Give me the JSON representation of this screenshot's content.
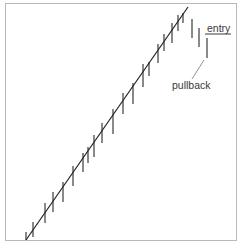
{
  "diagram": {
    "labels": {
      "entry": "entry",
      "pullback": "pullback"
    },
    "colors": {
      "bars": "#4a4a4a",
      "trendline": "#222222",
      "frame": "#b9b9b9",
      "text": "#3a3a3a"
    },
    "trendline": {
      "x1": 26,
      "y1": 240,
      "x2": 188,
      "y2": 7
    },
    "trend_bars": [
      {
        "x": 26,
        "top": 232,
        "bottom": 240
      },
      {
        "x": 33,
        "top": 222,
        "bottom": 237
      },
      {
        "x": 45,
        "top": 203,
        "bottom": 223
      },
      {
        "x": 53,
        "top": 192,
        "bottom": 212
      },
      {
        "x": 63,
        "top": 182,
        "bottom": 202
      },
      {
        "x": 73,
        "top": 166,
        "bottom": 186
      },
      {
        "x": 83,
        "top": 153,
        "bottom": 172
      },
      {
        "x": 88,
        "top": 147,
        "bottom": 163
      },
      {
        "x": 94,
        "top": 135,
        "bottom": 157
      },
      {
        "x": 102,
        "top": 123,
        "bottom": 143
      },
      {
        "x": 113,
        "top": 109,
        "bottom": 134
      },
      {
        "x": 123,
        "top": 93,
        "bottom": 114
      },
      {
        "x": 133,
        "top": 83,
        "bottom": 104
      },
      {
        "x": 143,
        "top": 64,
        "bottom": 87
      },
      {
        "x": 149,
        "top": 62,
        "bottom": 76
      },
      {
        "x": 158,
        "top": 44,
        "bottom": 63
      },
      {
        "x": 164,
        "top": 34,
        "bottom": 51
      },
      {
        "x": 172,
        "top": 23,
        "bottom": 43
      },
      {
        "x": 178,
        "top": 15,
        "bottom": 31
      },
      {
        "x": 183,
        "top": 13,
        "bottom": 23
      }
    ],
    "pullback_bars": [
      {
        "x": 192,
        "top": 19,
        "bottom": 38
      },
      {
        "x": 199,
        "top": 28,
        "bottom": 47
      },
      {
        "x": 207,
        "top": 38,
        "bottom": 58
      }
    ],
    "entry_line": {
      "x1": 205,
      "x2": 231,
      "y": 34
    },
    "pullback_pointer": {
      "x1": 204,
      "y1": 60,
      "x2": 192,
      "y2": 79
    }
  }
}
